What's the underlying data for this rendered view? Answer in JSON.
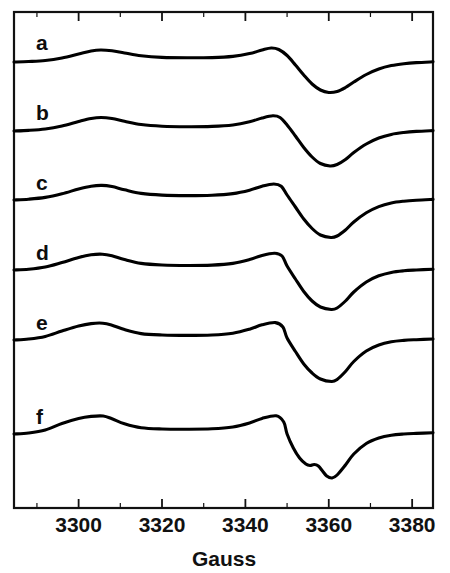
{
  "figure": {
    "kind": "epr-spectra-stack",
    "axis_title": "Gauss",
    "line_color": "#000000",
    "background_color": "#ffffff",
    "frame_color": "#111111"
  },
  "labels": {
    "a": "a",
    "b": "b",
    "c": "c",
    "d": "d",
    "e": "e",
    "f": "f"
  },
  "chart_data": {
    "type": "line",
    "title": "",
    "subtitle": "",
    "xlabel": "Gauss",
    "ylabel": "",
    "xlim": [
      3284.5,
      3385
    ],
    "grid": false,
    "legend": "none",
    "stacked_offset": true,
    "x_major_ticks": [
      3300,
      3320,
      3340,
      3360,
      3380
    ],
    "x_major_tick_labels": [
      "3300",
      "3320",
      "3340",
      "3360",
      "3380"
    ],
    "x_minor_ticks": [
      3290,
      3310,
      3330,
      3350,
      3370
    ],
    "tick_side": "both-top-and-bottom",
    "series": [
      {
        "name": "a",
        "label": "a",
        "baseline_y_px": 62,
        "description": "broad derivative-like EPR trace, shallow low-field hump, broad second peak, broad negative lobe",
        "points": [
          [
            3284.5,
            0.0
          ],
          [
            3288,
            -0.5
          ],
          [
            3292,
            -1.5
          ],
          [
            3296,
            -4.0
          ],
          [
            3300,
            -8.0
          ],
          [
            3303,
            -11.0
          ],
          [
            3305.3,
            -12.0
          ],
          [
            3308,
            -11.2
          ],
          [
            3311,
            -9.0
          ],
          [
            3315,
            -6.2
          ],
          [
            3320,
            -4.6
          ],
          [
            3326,
            -4.2
          ],
          [
            3332,
            -4.4
          ],
          [
            3337,
            -5.6
          ],
          [
            3341,
            -8.4
          ],
          [
            3344,
            -12.0
          ],
          [
            3346.2,
            -14.0
          ],
          [
            3348,
            -12.5
          ],
          [
            3350,
            -6.5
          ],
          [
            3352,
            3.0
          ],
          [
            3354,
            13.0
          ],
          [
            3356,
            22.0
          ],
          [
            3358,
            28.0
          ],
          [
            3360,
            30.5
          ],
          [
            3362,
            29.5
          ],
          [
            3364,
            25.5
          ],
          [
            3366,
            20.0
          ],
          [
            3369,
            12.5
          ],
          [
            3372,
            7.0
          ],
          [
            3375,
            3.6
          ],
          [
            3378,
            1.7
          ],
          [
            3381,
            0.6
          ],
          [
            3385,
            -0.2
          ]
        ]
      },
      {
        "name": "b",
        "label": "b",
        "baseline_y_px": 131,
        "description": "slightly sharper than a, deeper negative lobe",
        "points": [
          [
            3284.5,
            0.0
          ],
          [
            3288,
            -0.6
          ],
          [
            3292,
            -2.0
          ],
          [
            3296,
            -5.0
          ],
          [
            3300,
            -9.5
          ],
          [
            3303,
            -12.5
          ],
          [
            3305.4,
            -13.5
          ],
          [
            3308,
            -12.5
          ],
          [
            3311,
            -9.8
          ],
          [
            3315,
            -6.5
          ],
          [
            3320,
            -4.8
          ],
          [
            3326,
            -4.3
          ],
          [
            3332,
            -4.6
          ],
          [
            3337,
            -6.0
          ],
          [
            3341,
            -9.2
          ],
          [
            3344,
            -13.0
          ],
          [
            3346.6,
            -15.2
          ],
          [
            3348.3,
            -13.5
          ],
          [
            3350,
            -6.0
          ],
          [
            3352,
            5.0
          ],
          [
            3354,
            16.5
          ],
          [
            3356,
            26.0
          ],
          [
            3358,
            32.5
          ],
          [
            3360.3,
            35.0
          ],
          [
            3362,
            33.5
          ],
          [
            3364,
            28.5
          ],
          [
            3366,
            21.5
          ],
          [
            3369,
            13.0
          ],
          [
            3372,
            7.0
          ],
          [
            3375,
            3.4
          ],
          [
            3378,
            1.5
          ],
          [
            3381,
            0.4
          ],
          [
            3385,
            -0.4
          ]
        ]
      },
      {
        "name": "c",
        "label": "c",
        "baseline_y_px": 200,
        "description": "intermediate line width, sharper low-field hump",
        "points": [
          [
            3284.5,
            0.0
          ],
          [
            3288,
            -0.8
          ],
          [
            3292,
            -2.6
          ],
          [
            3296,
            -6.2
          ],
          [
            3300,
            -11.0
          ],
          [
            3303,
            -13.8
          ],
          [
            3305.6,
            -14.6
          ],
          [
            3308,
            -13.4
          ],
          [
            3311,
            -10.2
          ],
          [
            3315,
            -6.6
          ],
          [
            3320,
            -4.9
          ],
          [
            3326,
            -4.4
          ],
          [
            3332,
            -4.8
          ],
          [
            3337,
            -6.4
          ],
          [
            3341,
            -9.8
          ],
          [
            3344,
            -13.8
          ],
          [
            3346.8,
            -16.0
          ],
          [
            3348.6,
            -13.8
          ],
          [
            3350,
            -5.0
          ],
          [
            3352,
            7.0
          ],
          [
            3354,
            19.0
          ],
          [
            3356,
            28.5
          ],
          [
            3358,
            35.0
          ],
          [
            3360.5,
            37.5
          ],
          [
            3362,
            36.0
          ],
          [
            3364,
            30.0
          ],
          [
            3366,
            22.0
          ],
          [
            3369,
            12.8
          ],
          [
            3372,
            6.6
          ],
          [
            3375,
            3.0
          ],
          [
            3378,
            1.2
          ],
          [
            3381,
            0.2
          ],
          [
            3385,
            -0.6
          ]
        ]
      },
      {
        "name": "d",
        "label": "d",
        "baseline_y_px": 270,
        "description": "narrower lines, defined peaks",
        "points": [
          [
            3284.5,
            0.0
          ],
          [
            3288,
            -0.8
          ],
          [
            3292,
            -3.0
          ],
          [
            3296,
            -7.5
          ],
          [
            3300,
            -12.5
          ],
          [
            3303,
            -15.2
          ],
          [
            3305.7,
            -15.8
          ],
          [
            3308,
            -14.2
          ],
          [
            3311,
            -10.4
          ],
          [
            3315,
            -6.6
          ],
          [
            3320,
            -5.0
          ],
          [
            3326,
            -4.5
          ],
          [
            3332,
            -4.9
          ],
          [
            3337,
            -6.6
          ],
          [
            3341,
            -10.4
          ],
          [
            3344,
            -14.6
          ],
          [
            3347.0,
            -16.8
          ],
          [
            3348.8,
            -14.0
          ],
          [
            3350,
            -4.0
          ],
          [
            3352,
            9.0
          ],
          [
            3354,
            21.5
          ],
          [
            3356,
            31.0
          ],
          [
            3358,
            37.0
          ],
          [
            3360.6,
            39.5
          ],
          [
            3362,
            38.0
          ],
          [
            3364,
            31.0
          ],
          [
            3366,
            22.0
          ],
          [
            3369,
            12.0
          ],
          [
            3372,
            5.8
          ],
          [
            3375,
            2.4
          ],
          [
            3378,
            0.8
          ],
          [
            3381,
            0.0
          ],
          [
            3385,
            -0.8
          ]
        ]
      },
      {
        "name": "e",
        "label": "e",
        "baseline_y_px": 340,
        "description": "sharp low-field peak, steep zero crossing",
        "points": [
          [
            3284.5,
            0.0
          ],
          [
            3288,
            -1.0
          ],
          [
            3292,
            -3.6
          ],
          [
            3296,
            -9.0
          ],
          [
            3300,
            -14.0
          ],
          [
            3303,
            -16.4
          ],
          [
            3305.8,
            -16.8
          ],
          [
            3308,
            -14.8
          ],
          [
            3311,
            -10.4
          ],
          [
            3315,
            -6.4
          ],
          [
            3320,
            -5.0
          ],
          [
            3326,
            -4.6
          ],
          [
            3332,
            -5.0
          ],
          [
            3337,
            -6.8
          ],
          [
            3341,
            -10.8
          ],
          [
            3344,
            -15.2
          ],
          [
            3347.2,
            -17.4
          ],
          [
            3349.0,
            -13.0
          ],
          [
            3350,
            -2.0
          ],
          [
            3352,
            11.5
          ],
          [
            3354,
            24.0
          ],
          [
            3356,
            33.0
          ],
          [
            3358,
            39.0
          ],
          [
            3360.7,
            41.5
          ],
          [
            3362,
            39.5
          ],
          [
            3364,
            31.5
          ],
          [
            3366,
            21.5
          ],
          [
            3369,
            11.0
          ],
          [
            3372,
            5.0
          ],
          [
            3375,
            1.8
          ],
          [
            3378,
            0.4
          ],
          [
            3381,
            -0.3
          ],
          [
            3385,
            -1.0
          ]
        ]
      },
      {
        "name": "f",
        "label": "f",
        "baseline_y_px": 434,
        "description": "sharpest lines; resolved shoulder on the high-field negative lobe",
        "points": [
          [
            3284.5,
            0.0
          ],
          [
            3288,
            -1.0
          ],
          [
            3292,
            -4.0
          ],
          [
            3296,
            -10.5
          ],
          [
            3300,
            -15.5
          ],
          [
            3303,
            -17.6
          ],
          [
            3305.9,
            -18.0
          ],
          [
            3308,
            -15.2
          ],
          [
            3311,
            -10.2
          ],
          [
            3315,
            -6.2
          ],
          [
            3320,
            -5.0
          ],
          [
            3326,
            -4.8
          ],
          [
            3332,
            -5.2
          ],
          [
            3337,
            -7.0
          ],
          [
            3341,
            -11.0
          ],
          [
            3344,
            -15.6
          ],
          [
            3347.4,
            -18.2
          ],
          [
            3349.2,
            -12.0
          ],
          [
            3350,
            0.0
          ],
          [
            3351.5,
            14.0
          ],
          [
            3353,
            24.0
          ],
          [
            3354.5,
            30.0
          ],
          [
            3355.5,
            31.5
          ],
          [
            3356.5,
            30.5
          ],
          [
            3357.5,
            32.0
          ],
          [
            3358.5,
            37.0
          ],
          [
            3359.5,
            42.0
          ],
          [
            3360.8,
            44.0
          ],
          [
            3362,
            41.0
          ],
          [
            3364,
            31.0
          ],
          [
            3366,
            20.0
          ],
          [
            3369,
            9.5
          ],
          [
            3372,
            4.0
          ],
          [
            3375,
            1.2
          ],
          [
            3378,
            0.0
          ],
          [
            3381,
            -0.6
          ],
          [
            3385,
            -1.2
          ]
        ]
      }
    ]
  }
}
